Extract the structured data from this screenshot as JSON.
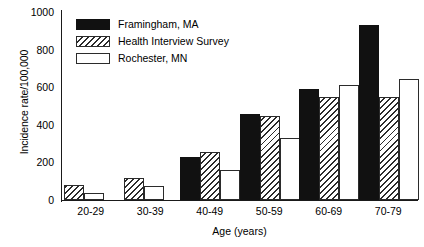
{
  "chart_data": {
    "type": "bar",
    "title": "",
    "xlabel": "Age (years)",
    "ylabel": "Incidence rate/100,000",
    "categories": [
      "20-29",
      "30-39",
      "40-49",
      "50-59",
      "60-69",
      "70-79"
    ],
    "series": [
      {
        "name": "Framingham, MA",
        "style": "solid-black",
        "values": [
          0,
          0,
          230,
          460,
          590,
          930
        ]
      },
      {
        "name": "Health Interview Survey",
        "style": "diagonal-hatch",
        "values": [
          80,
          115,
          255,
          445,
          550,
          550
        ]
      },
      {
        "name": "Rochester, MN",
        "style": "open-white",
        "values": [
          37,
          75,
          160,
          330,
          610,
          643
        ]
      }
    ],
    "ylim": [
      0,
      1000
    ],
    "yticks": [
      0,
      200,
      400,
      600,
      800,
      1000
    ],
    "ytick_labels": [
      "0",
      "200",
      "400",
      "600",
      "800",
      "1000"
    ],
    "grid": false,
    "legend_position": "top-left-inside",
    "colors": {
      "series1": "#111111",
      "series2": "#ffffff",
      "series2_hatch": "#2b2b2b",
      "series3": "#ffffff",
      "axis": "#1a1a1a",
      "background": "#ffffff"
    }
  },
  "axes": {
    "y_title": "Incidence rate/100,000",
    "x_title": "Age (years)",
    "ytick_0": "0",
    "ytick_1": "200",
    "ytick_2": "400",
    "ytick_3": "600",
    "ytick_4": "800",
    "ytick_5": "1000"
  },
  "legend": {
    "items": [
      {
        "label": "Framingham, MA"
      },
      {
        "label": "Health Interview Survey"
      },
      {
        "label": "Rochester, MN"
      }
    ]
  },
  "xticks": [
    {
      "label": "20-29"
    },
    {
      "label": "30-39"
    },
    {
      "label": "40-49"
    },
    {
      "label": "50-59"
    },
    {
      "label": "60-69"
    },
    {
      "label": "70-79"
    }
  ]
}
